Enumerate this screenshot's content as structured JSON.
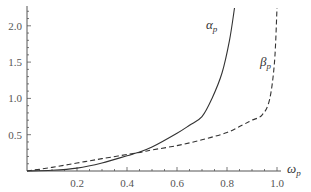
{
  "chart_data": {
    "type": "line",
    "title": "",
    "xlabel": "ω_p",
    "ylabel": "",
    "xlim": [
      0,
      1.0
    ],
    "ylim": [
      0,
      2.25
    ],
    "grid": false,
    "legend": "inline labels",
    "x_ticks": [
      "0.2",
      "0.4",
      "0.6",
      "0.8",
      "1.0"
    ],
    "y_ticks": [
      "0.5",
      "1.0",
      "1.5",
      "2.0"
    ],
    "series": [
      {
        "name": "α_p",
        "style": "solid",
        "color": "#333333",
        "x": [
          0.0,
          0.1,
          0.2,
          0.3,
          0.4,
          0.44,
          0.5,
          0.6,
          0.65,
          0.7,
          0.74,
          0.78,
          0.81,
          0.83
        ],
        "values": [
          0.0,
          0.01,
          0.04,
          0.11,
          0.21,
          0.25,
          0.33,
          0.52,
          0.63,
          0.75,
          1.0,
          1.35,
          1.8,
          2.25
        ]
      },
      {
        "name": "β_p",
        "style": "dashed",
        "color": "#333333",
        "x": [
          0.0,
          0.1,
          0.2,
          0.3,
          0.44,
          0.5,
          0.6,
          0.7,
          0.8,
          0.86,
          0.9,
          0.94,
          0.97,
          0.99,
          1.0
        ],
        "values": [
          0.0,
          0.05,
          0.11,
          0.17,
          0.25,
          0.29,
          0.35,
          0.43,
          0.53,
          0.63,
          0.7,
          0.77,
          0.98,
          1.5,
          2.25
        ]
      }
    ]
  },
  "labels": {
    "alpha_main": "α",
    "alpha_sub": "p",
    "beta_main": "β",
    "beta_sub": "p",
    "x_main": "ω",
    "x_sub": "p"
  }
}
